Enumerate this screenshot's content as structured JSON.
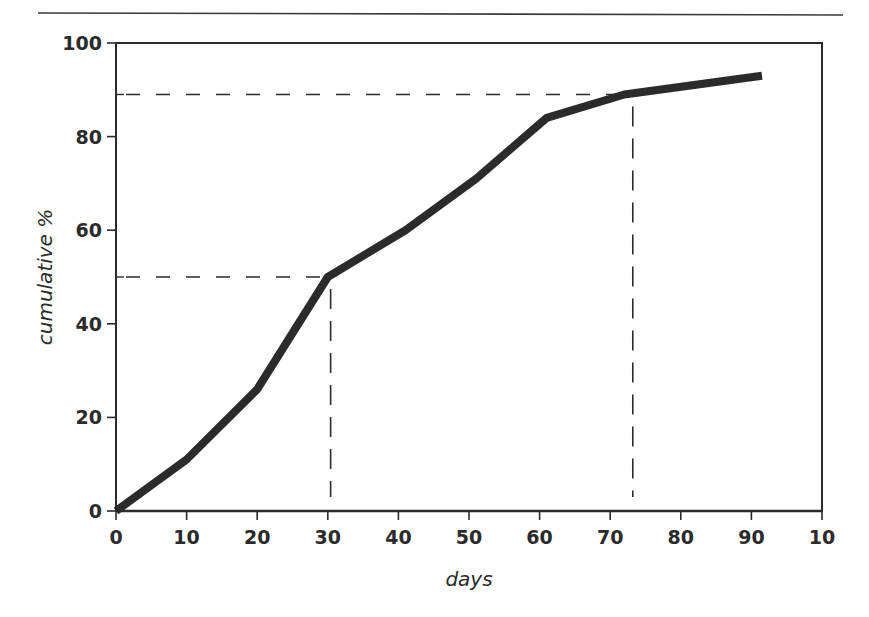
{
  "chart_data": {
    "type": "line",
    "title": "",
    "xlabel": "days",
    "ylabel": "cumulative %",
    "xlim": [
      0,
      100
    ],
    "ylim": [
      0,
      100
    ],
    "x_ticks": [
      0,
      10,
      20,
      30,
      40,
      50,
      60,
      70,
      80,
      90,
      100
    ],
    "x_tick_labels": [
      "0",
      "10",
      "20",
      "30",
      "40",
      "50",
      "60",
      "70",
      "80",
      "90",
      "10"
    ],
    "y_ticks": [
      0,
      20,
      40,
      60,
      80,
      100
    ],
    "y_tick_labels": [
      "0",
      "20",
      "40",
      "60",
      "80",
      "100"
    ],
    "y_minor_ticks": [
      50,
      89
    ],
    "grid": false,
    "legend": null,
    "series": [
      {
        "name": "cumulative %",
        "color": "#2b2b2b",
        "x": [
          0,
          10,
          20,
          30,
          41,
          51,
          61,
          72,
          91.5
        ],
        "y": [
          0,
          11,
          26,
          50,
          60,
          71,
          84,
          89,
          93
        ]
      }
    ],
    "annotations": [
      {
        "type": "dashed-guide",
        "from_y": 50,
        "to_x": 30.4,
        "description": "50% reached at ~30 days"
      },
      {
        "type": "dashed-guide",
        "from_y": 89,
        "to_x": 73.2,
        "description": "89% reached at ~73 days"
      }
    ]
  },
  "colors": {
    "ink": "#2b2b2b",
    "background": "#ffffff"
  }
}
